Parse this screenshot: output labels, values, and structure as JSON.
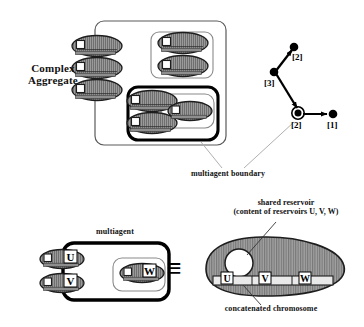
{
  "figure": {
    "labels": {
      "complex_aggregate": "Complex\nAggregate",
      "complex_aggregate_line1": "Complex",
      "complex_aggregate_line2": "Aggregate",
      "multiagent_boundary": "multiagent boundary",
      "multiagent": "multiagent",
      "shared_reservoir_line1": "shared reservoir",
      "shared_reservoir_line2": "(content of reservoirs U, V, W)",
      "concatenated_chromosome": "concatenated chromosome",
      "equivalence_symbol": "≡"
    },
    "graph": {
      "nodes": [
        {
          "id": "n2top",
          "label": "[2]",
          "type": "filled-dot"
        },
        {
          "id": "n3",
          "label": "[3]",
          "type": "filled-dot"
        },
        {
          "id": "n2mid",
          "label": "[2]",
          "type": "ringed-dot"
        },
        {
          "id": "n1",
          "label": "[1]",
          "type": "filled-dot"
        }
      ],
      "edges": [
        {
          "from": "n3",
          "to": "n2top",
          "arrow": true
        },
        {
          "from": "n3",
          "to": "n2mid",
          "arrow": true
        },
        {
          "from": "n2mid",
          "to": "n1",
          "arrow": true
        }
      ]
    },
    "agents": {
      "multiagent_members": [
        "U",
        "V",
        "W"
      ],
      "chromosome_genes": [
        "U",
        "V",
        "W"
      ]
    },
    "colors": {
      "agent_fill": "#9a9a9a",
      "agent_stroke": "#1a1a1a",
      "reservoir_fill": "#ffffff",
      "boundary_thin": "#555555",
      "boundary_bold": "#000000",
      "leader_line": "#9a9a9a",
      "oval_fill": "#9a9a9a",
      "text": "#111111"
    }
  }
}
